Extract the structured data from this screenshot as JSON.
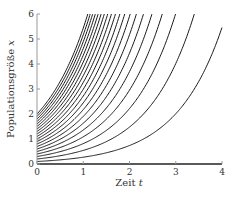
{
  "chart_data": {
    "type": "line",
    "title": "",
    "xlabel": "Zeit",
    "xlabel_var": "t",
    "ylabel": "Populationsgröße",
    "ylabel_var": "x",
    "xlim": [
      0,
      4
    ],
    "ylim": [
      0,
      6
    ],
    "x_ticks": [
      "0",
      "1",
      "2",
      "3",
      "4"
    ],
    "y_ticks": [
      "0",
      "1",
      "2",
      "3",
      "4",
      "5",
      "6"
    ],
    "grid": false,
    "legend": null,
    "model": "x(t) = x0 · e^t",
    "growth_rate": 1.0,
    "initial_values": [
      0,
      0.1,
      0.2,
      0.3,
      0.4,
      0.5,
      0.6,
      0.7,
      0.8,
      0.9,
      1.0,
      1.1,
      1.2,
      1.3,
      1.4,
      1.5,
      1.6,
      1.7,
      1.8,
      1.9,
      2.0
    ],
    "line_color": "#1a1a1a"
  }
}
